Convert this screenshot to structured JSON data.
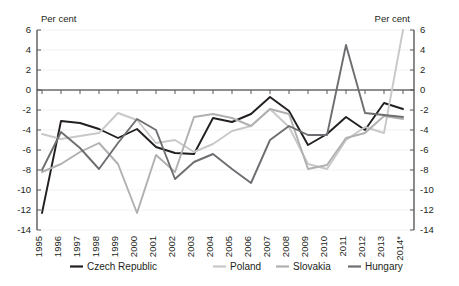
{
  "chart_data": {
    "type": "line",
    "title": "",
    "ylabel_left": "Per cent",
    "ylabel_right": "Per cent",
    "xlabel": "",
    "ylim": [
      -14,
      6
    ],
    "yticks": [
      6,
      4,
      2,
      0,
      -2,
      -4,
      -6,
      -8,
      -10,
      -12,
      -14
    ],
    "ytick_labels": [
      "6",
      "4",
      "2",
      "0",
      "-2",
      "-4",
      "-6",
      "-8",
      "-10",
      "-12",
      "-14"
    ],
    "grid": true,
    "legend_position": "bottom",
    "categories": [
      "1995",
      "1996",
      "1997",
      "1998",
      "1999",
      "2000",
      "2001",
      "2002",
      "2003",
      "2004",
      "2005",
      "2006",
      "2007",
      "2008",
      "2009",
      "2010",
      "2011",
      "2012",
      "2013",
      "2014*"
    ],
    "series": [
      {
        "name": "Czech Republic",
        "color": "#231f20",
        "width": 1.9,
        "values": [
          -12.3,
          -3.1,
          -3.3,
          -3.9,
          -4.8,
          -3.9,
          -5.7,
          -6.3,
          -6.4,
          -2.8,
          -3.2,
          -2.4,
          -0.7,
          -2.1,
          -5.5,
          -4.4,
          -2.7,
          -4.0,
          -1.3,
          -1.9
        ]
      },
      {
        "name": "Poland",
        "color": "#c8c8c8",
        "width": 1.9,
        "values": [
          -4.4,
          -4.9,
          -4.6,
          -4.3,
          -2.3,
          -3.0,
          -5.3,
          -5.0,
          -6.2,
          -5.4,
          -4.1,
          -3.6,
          -1.9,
          -3.7,
          -7.4,
          -7.9,
          -5.0,
          -3.7,
          -4.3,
          6.0
        ]
      },
      {
        "name": "Slovakia",
        "color": "#b0b0b0",
        "width": 1.9,
        "values": [
          -8.2,
          -7.4,
          -6.2,
          -5.3,
          -7.4,
          -12.3,
          -6.5,
          -8.2,
          -2.7,
          -2.4,
          -2.8,
          -3.6,
          -1.9,
          -2.4,
          -7.9,
          -7.5,
          -4.8,
          -4.3,
          -2.6,
          -2.9
        ]
      },
      {
        "name": "Hungary",
        "color": "#6d6e71",
        "width": 1.9,
        "values": [
          -8.0,
          -4.2,
          -5.8,
          -7.9,
          -5.3,
          -2.9,
          -4.0,
          -8.9,
          -7.2,
          -6.4,
          -7.9,
          -9.3,
          -5.0,
          -3.6,
          -4.5,
          -4.5,
          4.5,
          -2.3,
          -2.5,
          -2.7
        ]
      }
    ]
  },
  "legend": {
    "items": [
      {
        "label": "Czech Republic"
      },
      {
        "label": "Poland"
      },
      {
        "label": "Slovakia"
      },
      {
        "label": "Hungary"
      }
    ]
  }
}
